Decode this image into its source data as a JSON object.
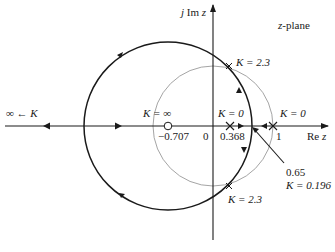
{
  "diagram": {
    "plane_label": "z-plane",
    "axes": {
      "imag_label_prefix": "j Im ",
      "imag_label_var": "z",
      "real_label_prefix": "Re ",
      "real_label_var": "z"
    },
    "tick_labels": {
      "zero_loc": "−0.707",
      "origin": "0",
      "pole_loc": "0.368",
      "one": "1"
    },
    "annotations": {
      "k_inf_left": "∞ ← K",
      "k_inf_zero": "K = ∞",
      "k_zero_pole1": "K = 0",
      "k_zero_pole2": "K = 0",
      "k_upper_cross": "K = 2.3",
      "k_lower_cross": "K = 2.3",
      "breakin_value": "0.65",
      "breakin_gain": "K = 0.196"
    },
    "colors": {
      "locus": "#1a1a1a",
      "unit_circle": "#9a9a9a",
      "axes": "#1a1a1a"
    }
  }
}
